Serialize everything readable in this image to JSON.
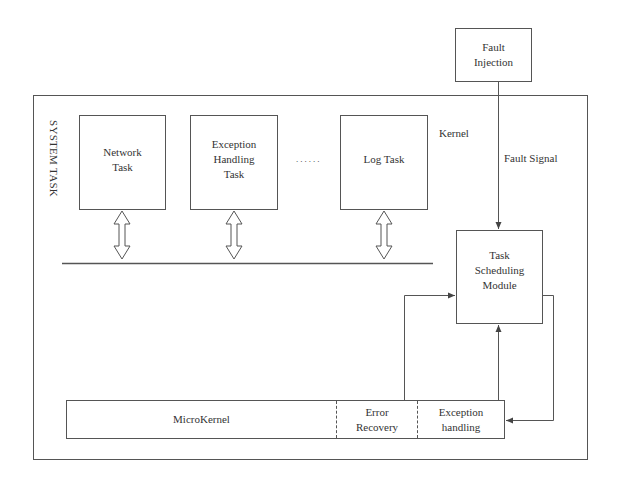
{
  "diagram": {
    "fault_injection": {
      "label_line1": "Fault",
      "label_line2": "Injection"
    },
    "system": {
      "label": "SYSTEM TASK",
      "kernel_label": "Kernel",
      "fault_signal_label": "Fault Signal",
      "tasks": [
        {
          "line1": "Network",
          "line2": "Task",
          "line3": ""
        },
        {
          "line1": "Exception",
          "line2": "Handling",
          "line3": "Task"
        },
        {
          "line1": "Log Task",
          "line2": "",
          "line3": ""
        }
      ],
      "ellipsis": "......",
      "scheduler": {
        "line1": "Task",
        "line2": "Scheduling",
        "line3": "Module"
      },
      "microkernel_bar": {
        "cells": [
          {
            "line1": "MicroKernel",
            "line2": ""
          },
          {
            "line1": "Error",
            "line2": "Recovery"
          },
          {
            "line1": "Exception",
            "line2": "handling"
          }
        ]
      }
    },
    "colors": {
      "stroke": "#555555",
      "text": "#333333",
      "background": "#ffffff"
    }
  }
}
